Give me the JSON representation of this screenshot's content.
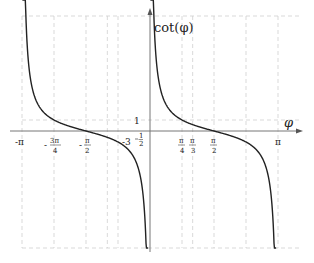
{
  "chart_data": {
    "type": "line",
    "title": "",
    "function": "cot(phi)",
    "xlabel": "φ",
    "ylabel": "cot(φ)",
    "xlim": [
      -3.3,
      3.5
    ],
    "ylim": [
      -10,
      10
    ],
    "x_ticks": [
      {
        "value": -3.14159,
        "label": "-π"
      },
      {
        "value": -2.35619,
        "label": "-3π/4"
      },
      {
        "value": -1.5708,
        "label": "-π/2"
      },
      {
        "value": 0.7854,
        "label": "π/4"
      },
      {
        "value": 1.0472,
        "label": "π/3"
      },
      {
        "value": 1.5708,
        "label": "π/2"
      },
      {
        "value": 3.14159,
        "label": "π"
      }
    ],
    "y_ticks": [
      {
        "value": 1,
        "label": "1"
      },
      {
        "value": -0.57735,
        "label": "-3^(-1/2)"
      }
    ],
    "vertical_gridlines_x": [
      -3.14159,
      -2.35619,
      -1.5708,
      -1.0472,
      -0.7854,
      0.7854,
      1.0472,
      1.5708,
      2.35619,
      3.14159
    ],
    "horizontal_gridlines_y": [
      1
    ],
    "grid": true,
    "grid_style": "dashed light gray",
    "series": [
      {
        "name": "cot(φ) branch 1",
        "x_range": [
          -3.1,
          -0.02
        ],
        "color": "#222222"
      },
      {
        "name": "cot(φ) branch 2",
        "x_range": [
          0.02,
          3.1
        ],
        "color": "#222222"
      }
    ],
    "legend": "none"
  },
  "labels": {
    "y_axis": "cot(φ)",
    "x_axis": "φ",
    "y_one": "1",
    "neg_inv_sqrt3_base": "-3",
    "neg_inv_sqrt3_exp_num": "1",
    "neg_inv_sqrt3_exp_den": "2",
    "neg_pi": "-π",
    "neg_3pi4_num": "3π",
    "neg_3pi4_den": "4",
    "neg_pi2_num": "π",
    "neg_pi2_den": "2",
    "pi4_num": "π",
    "pi4_den": "4",
    "pi3_num": "π",
    "pi3_den": "3",
    "pi2_num": "π",
    "pi2_den": "2",
    "pi": "π"
  }
}
